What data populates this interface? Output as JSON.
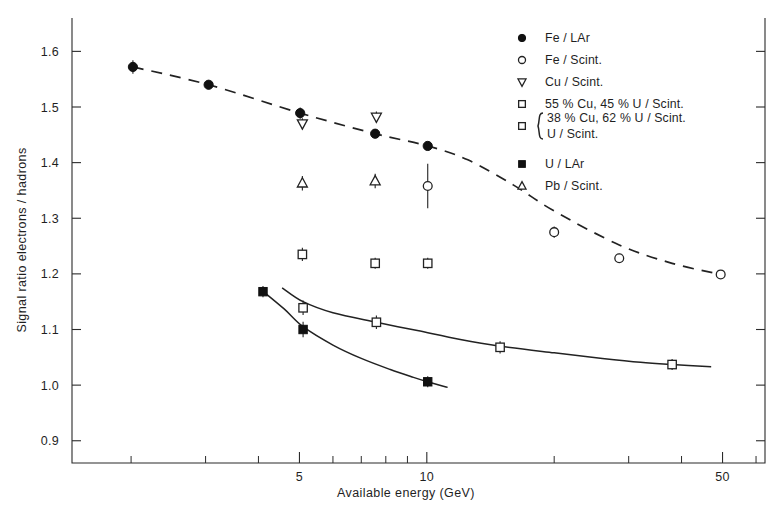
{
  "chart_data": {
    "type": "scatter",
    "title": "",
    "xlabel": "Available energy (GeV)",
    "ylabel": "Signal ratio electrons / hadrons",
    "xscale": "log",
    "xlim": [
      1.45,
      63
    ],
    "ylim": [
      0.86,
      1.66
    ],
    "xticks_labeled": [
      5,
      10,
      50
    ],
    "xtick_labels": [
      "5",
      "10",
      "50"
    ],
    "xticks_minor": [
      2,
      3,
      4,
      6,
      7,
      8,
      9,
      20,
      30,
      40,
      60
    ],
    "yticks": [
      0.9,
      1.0,
      1.1,
      1.2,
      1.3,
      1.4,
      1.5,
      1.6
    ],
    "ytick_labels": [
      "0.9",
      "1.0",
      "1.1",
      "1.2",
      "1.3",
      "1.4",
      "1.5",
      "1.6"
    ],
    "grid": false,
    "legend_position": "upper-right",
    "series": [
      {
        "name": "Fe / LAr",
        "marker": "filled-circle",
        "points": [
          {
            "x": 2.02,
            "y": 1.572,
            "yerr": 0.012
          },
          {
            "x": 3.05,
            "y": 1.54,
            "yerr": 0.008
          },
          {
            "x": 5.02,
            "y": 1.489,
            "yerr": 0.01
          },
          {
            "x": 7.55,
            "y": 1.452,
            "yerr": 0.008
          },
          {
            "x": 10.05,
            "y": 1.43,
            "yerr": 0.006
          }
        ]
      },
      {
        "name": "Fe / Scint.",
        "marker": "open-circle",
        "points": [
          {
            "x": 10.05,
            "y": 1.358,
            "yerr": 0.04
          },
          {
            "x": 20.0,
            "y": 1.275,
            "yerr": 0.01
          },
          {
            "x": 28.5,
            "y": 1.228,
            "yerr": 0.008
          },
          {
            "x": 49.5,
            "y": 1.199,
            "yerr": 0.006
          }
        ]
      },
      {
        "name": "Cu / Scint.",
        "marker": "down-triangle",
        "points": [
          {
            "x": 5.08,
            "y": 1.47,
            "yerr": 0.01
          },
          {
            "x": 7.6,
            "y": 1.482,
            "yerr": 0.01
          }
        ]
      },
      {
        "name": "55 % Cu, 45 % U / Scint.",
        "marker": "open-square",
        "points": [
          {
            "x": 5.08,
            "y": 1.235,
            "yerr": 0.012
          },
          {
            "x": 7.55,
            "y": 1.219,
            "yerr": 0.01
          },
          {
            "x": 10.05,
            "y": 1.219,
            "yerr": 0.01
          }
        ]
      },
      {
        "name": "38 % Cu, 62 % U / Scint. ; U / Scint.",
        "marker": "open-square",
        "points": [
          {
            "x": 5.1,
            "y": 1.139,
            "yerr": 0.013
          },
          {
            "x": 7.6,
            "y": 1.113,
            "yerr": 0.012
          },
          {
            "x": 14.9,
            "y": 1.068,
            "yerr": 0.011
          },
          {
            "x": 38.0,
            "y": 1.037,
            "yerr": 0.01
          }
        ]
      },
      {
        "name": "U / LAr",
        "marker": "filled-square",
        "points": [
          {
            "x": 4.1,
            "y": 1.168,
            "yerr": 0.01
          },
          {
            "x": 5.1,
            "y": 1.1,
            "yerr": 0.014
          },
          {
            "x": 10.05,
            "y": 1.006,
            "yerr": 0.01
          }
        ]
      },
      {
        "name": "Pb / Scint.",
        "marker": "up-triangle",
        "points": [
          {
            "x": 5.08,
            "y": 1.363,
            "yerr": 0.013
          },
          {
            "x": 7.55,
            "y": 1.367,
            "yerr": 0.013
          }
        ]
      }
    ],
    "fit_curves": [
      {
        "name": "fe-dashed-curve",
        "style": "dashed",
        "points": [
          [
            2.02,
            1.572
          ],
          [
            3.05,
            1.54
          ],
          [
            5.02,
            1.489
          ],
          [
            7.55,
            1.452
          ],
          [
            10.05,
            1.43
          ],
          [
            12.5,
            1.405
          ],
          [
            16,
            1.36
          ],
          [
            20,
            1.313
          ],
          [
            28.5,
            1.252
          ],
          [
            38,
            1.219
          ],
          [
            49.5,
            1.199
          ]
        ]
      },
      {
        "name": "cu-u-solid-curve",
        "style": "solid",
        "points": [
          [
            4.55,
            1.175
          ],
          [
            5.1,
            1.15
          ],
          [
            6.0,
            1.13
          ],
          [
            7.6,
            1.113
          ],
          [
            9.5,
            1.098
          ],
          [
            12,
            1.082
          ],
          [
            14.9,
            1.07
          ],
          [
            20,
            1.058
          ],
          [
            26,
            1.048
          ],
          [
            32,
            1.041
          ],
          [
            38,
            1.037
          ],
          [
            47,
            1.033
          ]
        ]
      },
      {
        "name": "u-lar-solid-curve",
        "style": "solid",
        "points": [
          [
            4.05,
            1.172
          ],
          [
            4.6,
            1.137
          ],
          [
            5.1,
            1.105
          ],
          [
            6.0,
            1.072
          ],
          [
            7.0,
            1.048
          ],
          [
            8.2,
            1.028
          ],
          [
            9.3,
            1.014
          ],
          [
            10.05,
            1.006
          ],
          [
            11.2,
            0.996
          ]
        ]
      }
    ]
  },
  "axes": {
    "ylabel": "Signal ratio electrons / hadrons",
    "xlabel": "Available energy (GeV)",
    "xtick_labels": [
      "5",
      "10",
      "50"
    ],
    "ytick_labels": [
      "1.6",
      "1.5",
      "1.4",
      "1.3",
      "1.2",
      "1.1",
      "1.0",
      "0.9"
    ]
  },
  "legend": {
    "entries": [
      {
        "marker": "filled-circle",
        "label": "Fe / LAr"
      },
      {
        "marker": "open-circle",
        "label": "Fe / Scint."
      },
      {
        "marker": "down-triangle",
        "label": "Cu / Scint."
      },
      {
        "marker": "open-square",
        "label": "55 % Cu, 45 % U / Scint."
      },
      {
        "marker": "open-square",
        "label": "38 % Cu, 62 % U / Scint.",
        "label2": "U / Scint.",
        "brace": true
      },
      {
        "marker": "filled-square",
        "label": "U / LAr"
      },
      {
        "marker": "up-triangle",
        "label": "Pb / Scint."
      }
    ]
  }
}
